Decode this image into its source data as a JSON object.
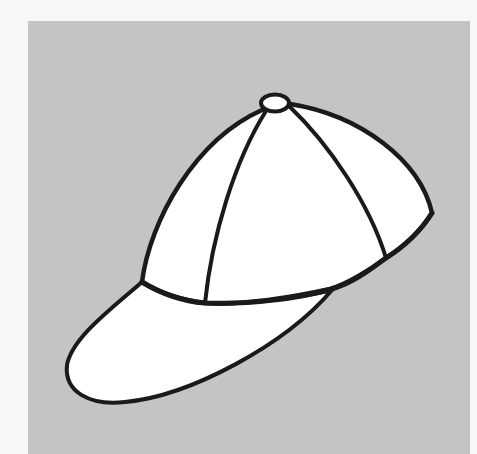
{
  "image": {
    "subject": "baseball cap line drawing",
    "style": "black outline coloring illustration on gray background",
    "colors": {
      "page_background": "#f7f7f7",
      "panel_background": "#c4c4c4",
      "cap_fill": "#ffffff",
      "outline": "#1a1a1a"
    },
    "parts": [
      "button",
      "crown",
      "left-seam",
      "right-seam",
      "visor"
    ]
  }
}
